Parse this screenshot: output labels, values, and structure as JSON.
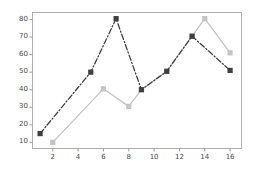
{
  "chart_data": {
    "type": "line",
    "title": "",
    "xlabel": "",
    "ylabel": "",
    "xlim": [
      0.4,
      16.9
    ],
    "ylim": [
      6.5,
      84.0
    ],
    "grid": false,
    "legend": "none",
    "xticks": [
      2,
      4,
      6,
      8,
      10,
      12,
      14,
      16
    ],
    "yticks": [
      10,
      20,
      30,
      40,
      50,
      60,
      70,
      80
    ],
    "series": [
      {
        "name": "series-dark-dashed",
        "color": "#404040",
        "linestyle": "dashed",
        "marker": "square",
        "x": [
          1,
          5,
          7,
          9,
          11,
          13,
          16
        ],
        "values": [
          15,
          50,
          80.5,
          40,
          50.5,
          70.5,
          51
        ]
      },
      {
        "name": "series-light-solid",
        "color": "#c4c4c4",
        "linestyle": "solid",
        "marker": "square",
        "x": [
          2,
          6,
          8,
          9,
          11,
          13,
          14,
          16
        ],
        "values": [
          10,
          40.5,
          30.5,
          40,
          50.5,
          70.5,
          80.5,
          61
        ]
      }
    ]
  },
  "axes": {
    "spine_color": "#b0b0b0",
    "tick_color": "#9a9a9a",
    "label_color": "#4a4a4a",
    "background": "#ffffff"
  }
}
